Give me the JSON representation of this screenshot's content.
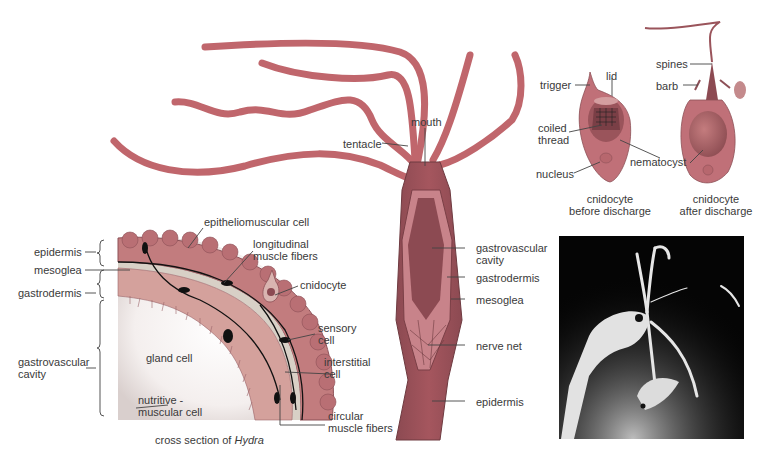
{
  "figure": {
    "colors": {
      "tentacle": "#c0666c",
      "body_dark": "#8c4a52",
      "body_mid": "#b06068",
      "tissue_light": "#d9a9a0",
      "mesoglea": "#c9c3b8",
      "line": "#333333",
      "photo_bg": "#050505"
    }
  },
  "cross_section": {
    "caption_prefix": "cross section of ",
    "caption_italic": "Hydra",
    "left_labels": {
      "epidermis": "epidermis",
      "mesoglea": "mesoglea",
      "gastrodermis": "gastrodermis",
      "gastrovascular_1": "gastrovascular",
      "gastrovascular_2": "cavity"
    },
    "labels": {
      "epitheliomuscular": "epitheliomuscular cell",
      "longitudinal_1": "longitudinal",
      "longitudinal_2": "muscle fibers",
      "cnidocyte": "cnidocyte",
      "sensory_1": "sensory",
      "sensory_2": "cell",
      "interstitial_1": "interstitial",
      "interstitial_2": "cell",
      "gland": "gland cell",
      "nutritive_1": "nutritive -",
      "nutritive_2": "muscular cell",
      "circular_1": "circular",
      "circular_2": "muscle fibers"
    }
  },
  "whole_body": {
    "labels": {
      "mouth": "mouth",
      "tentacle": "tentacle",
      "gastrovascular_1": "gastrovascular",
      "gastrovascular_2": "cavity",
      "gastrodermis": "gastrodermis",
      "mesoglea": "mesoglea",
      "nerve_net": "nerve net",
      "epidermis": "epidermis"
    }
  },
  "cnidocytes": {
    "before": {
      "trigger": "trigger",
      "lid": "lid",
      "coiled_1": "coiled",
      "coiled_2": "thread",
      "nucleus": "nucleus",
      "caption_1": "cnidocyte",
      "caption_2": "before discharge"
    },
    "after": {
      "spines": "spines",
      "barb": "barb",
      "caption_1": "cnidocyte",
      "caption_2": "after discharge"
    },
    "nematocyst": "nematocyst"
  },
  "photo": {
    "description": "micrograph of Hydra capturing prey"
  }
}
